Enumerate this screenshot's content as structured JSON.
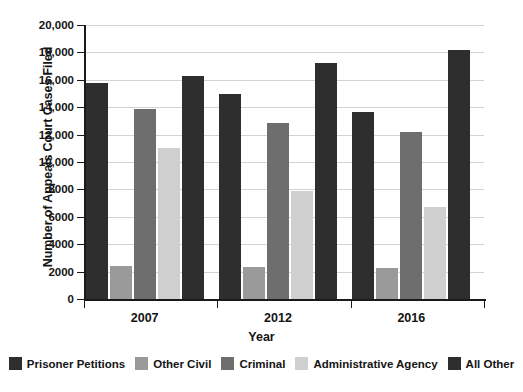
{
  "chart_data": {
    "type": "bar",
    "title": "",
    "xlabel": "Year",
    "ylabel": "Number of Appeals Court Cases Filed",
    "categories": [
      "2007",
      "2012",
      "2016"
    ],
    "series": [
      {
        "name": "Prisoner Petitions",
        "color": "#2e2e2e",
        "values": [
          15750,
          15000,
          13650
        ]
      },
      {
        "name": "Other Civil",
        "color": "#9a9a9a",
        "values": [
          2400,
          2350,
          2300
        ]
      },
      {
        "name": "Criminal",
        "color": "#6e6e6e",
        "values": [
          13900,
          12850,
          12200
        ]
      },
      {
        "name": "Administrative Agency",
        "color": "#cfcfcf",
        "values": [
          11000,
          7900,
          6700
        ]
      },
      {
        "name": "All Other",
        "color": "#2e2e2e",
        "values": [
          16300,
          17200,
          18150
        ]
      }
    ],
    "ylim": [
      0,
      20000
    ],
    "ytick_values": [
      0,
      2000,
      4000,
      6000,
      8000,
      10000,
      12000,
      14000,
      16000,
      18000,
      20000
    ],
    "ytick_labels": [
      "0",
      "2000",
      "4000",
      "6000",
      "8000",
      "10,000",
      "12,000",
      "14,000",
      "16,000",
      "18,000",
      "20,000"
    ],
    "grid": true,
    "legend_position": "bottom"
  },
  "axes": {
    "y_title": "Number of Appeals Court Cases Filed",
    "x_title": "Year"
  }
}
